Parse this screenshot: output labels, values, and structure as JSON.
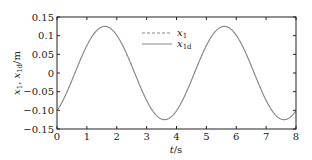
{
  "chart_data": {
    "type": "line",
    "title": "",
    "xlabel": "t/s",
    "ylabel": "x1, x1d/m",
    "xlim": [
      0,
      8
    ],
    "ylim": [
      -0.15,
      0.15
    ],
    "xticks": [
      0,
      1,
      2,
      3,
      4,
      5,
      6,
      7,
      8
    ],
    "xtick_labels": [
      "0",
      "1",
      "2",
      "3",
      "4",
      "5",
      "6",
      "7",
      "8"
    ],
    "yticks": [
      0.15,
      0.1,
      0.05,
      0,
      -0.05,
      -0.1,
      -0.15
    ],
    "ytick_labels": [
      "0.15",
      "0.1",
      "0.05",
      "0",
      "−0.05",
      "−0.10",
      "−0.15"
    ],
    "grid": false,
    "legend_position": "upper center",
    "x": [
      0,
      0.4,
      0.8,
      1.2,
      1.6,
      2.0,
      2.4,
      2.8,
      3.2,
      3.6,
      4.0,
      4.4,
      4.8,
      5.2,
      5.6,
      6.0,
      6.4,
      6.8,
      7.2,
      7.6,
      8.0
    ],
    "series": [
      {
        "name": "x1",
        "style": "dashed",
        "color": "#888888",
        "values": [
          -0.101,
          -0.073,
          -0.039,
          0.0,
          0.125,
          0.119,
          0.101,
          0.073,
          0.039,
          -0.125,
          -0.101,
          -0.073,
          -0.039,
          0.0,
          0.125,
          0.119,
          0.101,
          0.073,
          0.039,
          -0.125,
          -0.101
        ]
      },
      {
        "name": "x1d",
        "style": "solid",
        "color": "#888888",
        "values": [
          -0.101,
          -0.073,
          -0.039,
          0.0,
          0.125,
          0.119,
          0.101,
          0.073,
          0.039,
          -0.125,
          -0.101,
          -0.073,
          -0.039,
          0.0,
          0.125,
          0.119,
          0.101,
          0.073,
          0.039,
          -0.125,
          -0.101
        ]
      }
    ],
    "model": {
      "amplitude": 0.125,
      "period": 4,
      "phase_shift": 0.6
    }
  },
  "legend": {
    "items": [
      {
        "label_main": "x",
        "label_sub": "1",
        "style": "dashed"
      },
      {
        "label_main": "x",
        "label_sub": "1d",
        "style": "solid"
      }
    ]
  },
  "axes": {
    "xlabel_main": "t",
    "xlabel_unit": "/s",
    "ylabel_main": "x",
    "ylabel_sub1": "1",
    "ylabel_sep": ", ",
    "ylabel_sub2": "1d",
    "ylabel_unit": "/m"
  }
}
